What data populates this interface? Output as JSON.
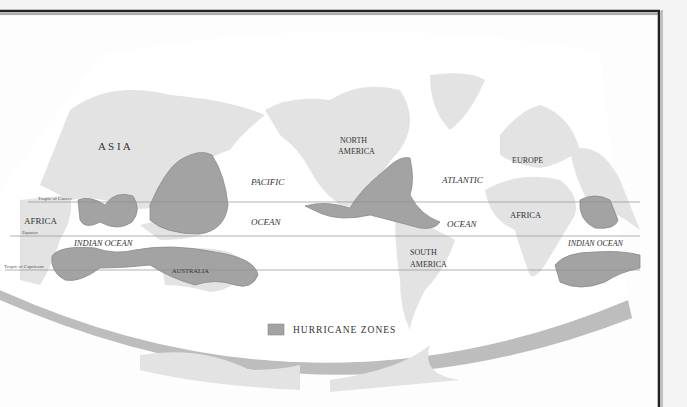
{
  "map": {
    "title_legend": "HURRICANE ZONES",
    "colors": {
      "background": "#f4f4f4",
      "ocean": "#ffffff",
      "land": "#e3e3e3",
      "zone": "#a3a3a3",
      "zone_stroke": "#8a8a8a",
      "frame": "#222222",
      "rim": "#b9b9b9"
    },
    "labels": {
      "asia": "A S I A",
      "africa_west": "AFRICA",
      "indian_ocean_west": "INDIAN OCEAN",
      "australia": "AUSTRALIA",
      "pacific": "PACIFIC",
      "ocean_pacific": "OCEAN",
      "north_america_1": "NORTH",
      "north_america_2": "AMERICA",
      "atlantic": "ATLANTIC",
      "ocean_atlantic": "OCEAN",
      "europe": "EUROPE",
      "africa_east": "AFRICA",
      "south_america_1": "SOUTH",
      "south_america_2": "AMERICA",
      "indian_ocean_east": "INDIAN OCEAN"
    },
    "lines": {
      "tropic_cancer": "Tropic of Cancer",
      "equator": "Equator",
      "tropic_capricorn": "Tropic of Capricorn"
    }
  }
}
